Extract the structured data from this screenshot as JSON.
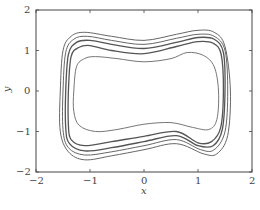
{
  "chart_data": {
    "type": "line",
    "title": "",
    "xlabel": "x",
    "ylabel": "y",
    "xlim": [
      -2,
      2
    ],
    "ylim": [
      -2,
      2
    ],
    "xticks": [
      "-2",
      "-1",
      "0",
      "1",
      "2"
    ],
    "yticks": [
      "2",
      "1",
      "0",
      "-1",
      "-2"
    ],
    "grid": false,
    "legend": null,
    "series": [
      {
        "name": "loop-1-outer",
        "points": [
          [
            -1.55,
            0
          ],
          [
            -1.5,
            1.0
          ],
          [
            -1.35,
            1.35
          ],
          [
            -1.1,
            1.45
          ],
          [
            -0.6,
            1.35
          ],
          [
            0,
            1.25
          ],
          [
            0.6,
            1.4
          ],
          [
            1.0,
            1.5
          ],
          [
            1.3,
            1.45
          ],
          [
            1.5,
            1.1
          ],
          [
            1.6,
            0
          ],
          [
            1.55,
            -1.1
          ],
          [
            1.35,
            -1.55
          ],
          [
            1.1,
            -1.55
          ],
          [
            0.6,
            -1.3
          ],
          [
            0,
            -1.45
          ],
          [
            -0.6,
            -1.6
          ],
          [
            -1.1,
            -1.7
          ],
          [
            -1.4,
            -1.5
          ],
          [
            -1.55,
            -1.0
          ],
          [
            -1.55,
            0
          ]
        ]
      },
      {
        "name": "loop-2",
        "points": [
          [
            -1.5,
            0
          ],
          [
            -1.45,
            0.95
          ],
          [
            -1.3,
            1.28
          ],
          [
            -1.05,
            1.35
          ],
          [
            -0.6,
            1.25
          ],
          [
            0,
            1.15
          ],
          [
            0.6,
            1.3
          ],
          [
            1.0,
            1.4
          ],
          [
            1.3,
            1.35
          ],
          [
            1.5,
            1.0
          ],
          [
            1.55,
            0
          ],
          [
            1.5,
            -1.0
          ],
          [
            1.3,
            -1.45
          ],
          [
            1.05,
            -1.45
          ],
          [
            0.6,
            -1.2
          ],
          [
            0,
            -1.35
          ],
          [
            -0.6,
            -1.5
          ],
          [
            -1.1,
            -1.58
          ],
          [
            -1.4,
            -1.4
          ],
          [
            -1.5,
            -0.95
          ],
          [
            -1.5,
            0
          ]
        ]
      },
      {
        "name": "loop-3",
        "points": [
          [
            -1.45,
            0
          ],
          [
            -1.4,
            0.9
          ],
          [
            -1.25,
            1.2
          ],
          [
            -1.0,
            1.25
          ],
          [
            -0.6,
            1.15
          ],
          [
            0,
            1.05
          ],
          [
            0.6,
            1.2
          ],
          [
            1.0,
            1.32
          ],
          [
            1.3,
            1.28
          ],
          [
            1.47,
            0.95
          ],
          [
            1.5,
            0
          ],
          [
            1.45,
            -0.95
          ],
          [
            1.28,
            -1.35
          ],
          [
            1.0,
            -1.35
          ],
          [
            0.6,
            -1.1
          ],
          [
            0,
            -1.25
          ],
          [
            -0.6,
            -1.4
          ],
          [
            -1.1,
            -1.48
          ],
          [
            -1.38,
            -1.3
          ],
          [
            -1.45,
            -0.9
          ],
          [
            -1.45,
            0
          ]
        ]
      },
      {
        "name": "loop-4",
        "points": [
          [
            -1.4,
            0
          ],
          [
            -1.35,
            0.85
          ],
          [
            -1.2,
            1.08
          ],
          [
            -1.0,
            1.12
          ],
          [
            -0.6,
            1.0
          ],
          [
            0,
            0.92
          ],
          [
            0.6,
            1.1
          ],
          [
            1.0,
            1.22
          ],
          [
            1.28,
            1.18
          ],
          [
            1.43,
            0.9
          ],
          [
            1.47,
            0
          ],
          [
            1.42,
            -0.9
          ],
          [
            1.25,
            -1.25
          ],
          [
            1.0,
            -1.28
          ],
          [
            0.6,
            -1.0
          ],
          [
            0,
            -1.12
          ],
          [
            -0.6,
            -1.25
          ],
          [
            -1.1,
            -1.35
          ],
          [
            -1.35,
            -1.2
          ],
          [
            -1.4,
            -0.85
          ],
          [
            -1.4,
            0
          ]
        ]
      },
      {
        "name": "loop-5-inner",
        "points": [
          [
            -1.3,
            0
          ],
          [
            -1.25,
            0.6
          ],
          [
            -1.1,
            0.8
          ],
          [
            -0.9,
            0.85
          ],
          [
            -0.5,
            0.8
          ],
          [
            0,
            0.72
          ],
          [
            0.5,
            0.8
          ],
          [
            0.8,
            0.95
          ],
          [
            1.1,
            0.88
          ],
          [
            1.3,
            0.6
          ],
          [
            1.38,
            0
          ],
          [
            1.35,
            -0.7
          ],
          [
            1.2,
            -0.95
          ],
          [
            0.9,
            -0.9
          ],
          [
            0.5,
            -0.78
          ],
          [
            0,
            -0.82
          ],
          [
            -0.5,
            -0.95
          ],
          [
            -0.9,
            -1.0
          ],
          [
            -1.2,
            -0.85
          ],
          [
            -1.3,
            -0.5
          ],
          [
            -1.3,
            0
          ]
        ]
      }
    ]
  },
  "axes": {
    "xlabel": "x",
    "ylabel": "y",
    "xtick_labels": [
      "−2",
      "−1",
      "0",
      "1",
      "2"
    ],
    "ytick_labels": [
      "2",
      "1",
      "0",
      "−1",
      "−2"
    ]
  }
}
